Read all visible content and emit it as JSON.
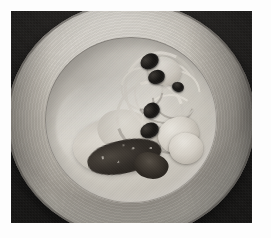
{
  "image": {
    "kind": "photograph",
    "subject": "plated-dish",
    "caption": "Overhead photograph of a round ceramic plate on a dark surface holding a dish of pale dumplings, ribbons of pasta or onion, black olives and a herb-crusted fillet",
    "orientation": "landscape",
    "mat": {
      "color": "#fdfdfd",
      "inset_px": 11
    },
    "backdrop": {
      "name": "dark-tabletop",
      "color": "#121110",
      "texture": "fine woven cloth"
    },
    "plate": {
      "name": "round-ceramic-plate",
      "shape": "circle",
      "rim_color": "#c2bdb4",
      "well_color": "#ddd9d1",
      "edge_color": "#4e4b47",
      "highlight": "upper-left specular band",
      "detail": "concentric turned rings on the rim"
    },
    "food": {
      "items": [
        {
          "name": "pasta-ribbons",
          "label": "Ribbons of pasta / onion",
          "count": 6,
          "color": "#ece8e0"
        },
        {
          "name": "black-olives",
          "label": "Black olives",
          "count": 5,
          "color": "#141210"
        },
        {
          "name": "dumplings",
          "label": "Pale dumplings / gnocchi",
          "count": 3,
          "color": "#ddd8cf"
        },
        {
          "name": "fillet",
          "label": "Pale fillet",
          "count": 2,
          "color": "#d8d3ca"
        },
        {
          "name": "herb-crust",
          "label": "Dark herb crust / tapenade",
          "count": 2,
          "color": "#2e2924"
        },
        {
          "name": "sauce-pool",
          "label": "Pale cream sauce",
          "count": 1,
          "color": "#f2f0ea"
        }
      ]
    },
    "palette": {
      "white": "#fdfdfd",
      "near_black": "#0a0a09",
      "plate_light": "#d9d6cf",
      "plate_mid": "#b4afa6",
      "plate_dark": "#4e4b47",
      "olive_black": "#141210",
      "crust_brown": "#2e2924"
    }
  }
}
